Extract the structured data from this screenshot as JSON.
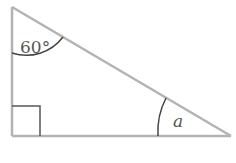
{
  "diagram": {
    "type": "right-triangle",
    "vertices": {
      "top": [
        12,
        7
      ],
      "right_angle": [
        12,
        136
      ],
      "bottom_right": [
        231,
        136
      ]
    },
    "angles": {
      "top_angle_label": "60°",
      "bottom_right_angle_label": "a",
      "right_angle_marker": true
    },
    "colors": {
      "side": "#b3b3b3",
      "arc": "#444444",
      "text": "#555555"
    }
  }
}
